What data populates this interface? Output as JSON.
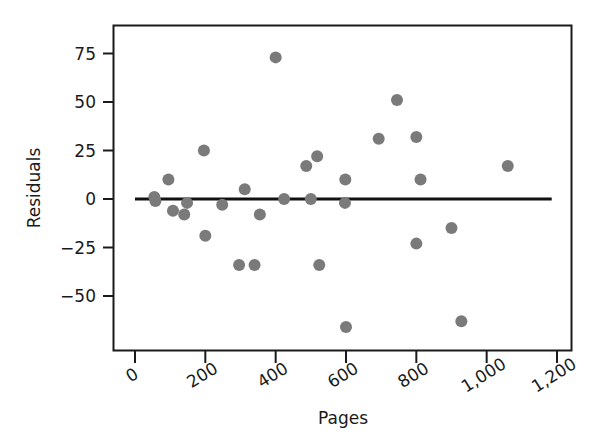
{
  "chart_data": {
    "type": "scatter",
    "title": "",
    "xlabel": "Pages",
    "ylabel": "Residuals",
    "xlim": [
      0,
      1200
    ],
    "ylim": [
      -80,
      83
    ],
    "grid": false,
    "legend": "none",
    "xticks": [
      0,
      200,
      400,
      600,
      800,
      1000,
      1200
    ],
    "xtick_labels": [
      "0",
      "200",
      "400",
      "600",
      "800",
      "1,000",
      "1,200"
    ],
    "yticks": [
      75,
      50,
      25,
      0,
      -25,
      -50
    ],
    "ytick_labels": [
      "75",
      "50",
      "25",
      "0",
      "−25",
      "−50"
    ],
    "point_color": "#7a7a7a",
    "point_radius_px": 6,
    "reference_line": {
      "label": "zero residual line",
      "y": 0,
      "x_start": 0,
      "x_end": 1185,
      "color": "#111111",
      "width_px": 3
    },
    "points": [
      {
        "x": 55,
        "y": 1
      },
      {
        "x": 58,
        "y": -1
      },
      {
        "x": 95,
        "y": 10
      },
      {
        "x": 108,
        "y": -6
      },
      {
        "x": 140,
        "y": -8
      },
      {
        "x": 148,
        "y": -2
      },
      {
        "x": 196,
        "y": 25
      },
      {
        "x": 200,
        "y": -19
      },
      {
        "x": 248,
        "y": -3
      },
      {
        "x": 296,
        "y": -34
      },
      {
        "x": 312,
        "y": 5
      },
      {
        "x": 340,
        "y": -34
      },
      {
        "x": 355,
        "y": -8
      },
      {
        "x": 400,
        "y": 73
      },
      {
        "x": 424,
        "y": 0
      },
      {
        "x": 487,
        "y": 17
      },
      {
        "x": 500,
        "y": 0
      },
      {
        "x": 518,
        "y": 22
      },
      {
        "x": 524,
        "y": -34
      },
      {
        "x": 597,
        "y": -2
      },
      {
        "x": 598,
        "y": 10
      },
      {
        "x": 600,
        "y": -66
      },
      {
        "x": 693,
        "y": 31
      },
      {
        "x": 745,
        "y": 51
      },
      {
        "x": 800,
        "y": 32
      },
      {
        "x": 800,
        "y": -23
      },
      {
        "x": 812,
        "y": 10
      },
      {
        "x": 900,
        "y": -15
      },
      {
        "x": 928,
        "y": -63
      },
      {
        "x": 1060,
        "y": 17
      }
    ]
  },
  "axes": {
    "frame_color": "#1a1a1a",
    "frame_width_px": 2
  }
}
